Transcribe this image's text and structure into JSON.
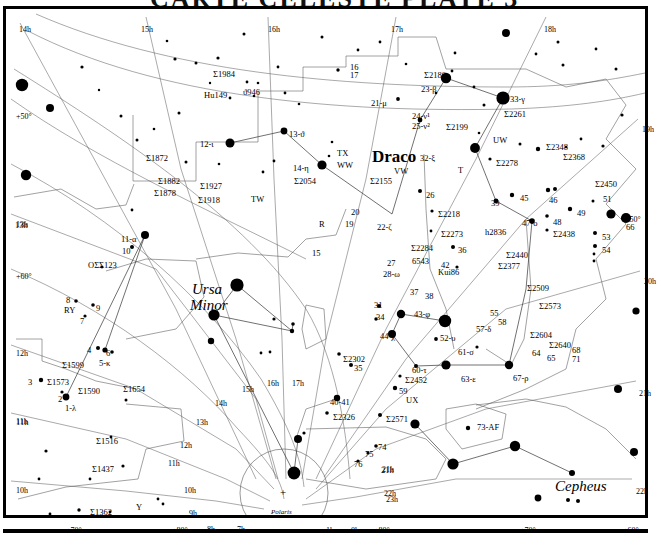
{
  "page": {
    "title_clipped": "CARTE CELESTE  PLATE 3",
    "width": 657,
    "height": 539
  },
  "constellations": [
    {
      "name": "Draco",
      "x": 366,
      "y": 139,
      "style": "draco"
    },
    {
      "name": "Ursa",
      "x": 186,
      "y": 273,
      "style": "const"
    },
    {
      "name": "Minor",
      "x": 184,
      "y": 289,
      "style": "const"
    },
    {
      "name": "Cepheus",
      "x": 549,
      "y": 470,
      "style": "const"
    }
  ],
  "pole": {
    "label": "Polaris",
    "x": 271,
    "y": 504,
    "marker": "+",
    "marker_x": 276,
    "marker_y": 483
  },
  "ra_labels": [
    {
      "t": "14h",
      "x": 13,
      "y": 17
    },
    {
      "t": "15h",
      "x": 135,
      "y": 17
    },
    {
      "t": "16h",
      "x": 262,
      "y": 17
    },
    {
      "t": "17h",
      "x": 385,
      "y": 17
    },
    {
      "t": "18h",
      "x": 538,
      "y": 17
    },
    {
      "t": "19h",
      "x": 636,
      "y": 117
    },
    {
      "t": "20h",
      "x": 638,
      "y": 269
    },
    {
      "t": "21h",
      "x": 633,
      "y": 381
    },
    {
      "t": "22h",
      "x": 630,
      "y": 479
    },
    {
      "t": "13h",
      "x": 10,
      "y": 212
    },
    {
      "t": "12h",
      "x": 10,
      "y": 341
    },
    {
      "t": "11h",
      "x": 10,
      "y": 409
    },
    {
      "t": "10h",
      "x": 10,
      "y": 478
    },
    {
      "t": "14h",
      "x": 209,
      "y": 391
    },
    {
      "t": "15h",
      "x": 236,
      "y": 377
    },
    {
      "t": "16h",
      "x": 261,
      "y": 371
    },
    {
      "t": "17h",
      "x": 286,
      "y": 371
    },
    {
      "t": "13h",
      "x": 190,
      "y": 410
    },
    {
      "t": "12h",
      "x": 174,
      "y": 433
    },
    {
      "t": "11h",
      "x": 162,
      "y": 451
    },
    {
      "t": "10h",
      "x": 178,
      "y": 478
    },
    {
      "t": "9h",
      "x": 183,
      "y": 501
    },
    {
      "t": "8h",
      "x": 201,
      "y": 517
    },
    {
      "t": "7h",
      "x": 231,
      "y": 517
    },
    {
      "t": "1h",
      "x": 320,
      "y": 518
    },
    {
      "t": "0h",
      "x": 345,
      "y": 518
    },
    {
      "t": "23h",
      "x": 380,
      "y": 487
    },
    {
      "t": "22h",
      "x": 378,
      "y": 481
    },
    {
      "t": "21h",
      "x": 376,
      "y": 457
    }
  ],
  "dec_labels": [
    {
      "t": "+50°",
      "x": 10,
      "y": 104
    },
    {
      "t": "+60°",
      "x": 10,
      "y": 264
    },
    {
      "t": "+70°",
      "x": 60,
      "y": 518
    },
    {
      "t": "+80°",
      "x": 166,
      "y": 518
    },
    {
      "t": "+80°",
      "x": 368,
      "y": 518
    },
    {
      "t": "+70°",
      "x": 514,
      "y": 518
    },
    {
      "t": "+60°",
      "x": 617,
      "y": 518
    },
    {
      "t": "+50°",
      "x": 619,
      "y": 207
    }
  ],
  "star_labels": [
    {
      "t": "Σ1984",
      "x": 207,
      "y": 61
    },
    {
      "t": "Hu149",
      "x": 198,
      "y": 82
    },
    {
      "t": "ϑ946",
      "x": 237,
      "y": 79
    },
    {
      "t": "16",
      "x": 344,
      "y": 54
    },
    {
      "t": "17",
      "x": 344,
      "y": 62
    },
    {
      "t": "Σ2180",
      "x": 418,
      "y": 62
    },
    {
      "t": "23-β",
      "x": 415,
      "y": 76
    },
    {
      "t": "21-μ",
      "x": 365,
      "y": 90
    },
    {
      "t": "24-ν¹",
      "x": 406,
      "y": 103
    },
    {
      "t": "25-ν²",
      "x": 406,
      "y": 113
    },
    {
      "t": "Σ2199",
      "x": 440,
      "y": 114
    },
    {
      "t": "33-γ",
      "x": 504,
      "y": 86
    },
    {
      "t": "Σ2261",
      "x": 498,
      "y": 101
    },
    {
      "t": "UW",
      "x": 487,
      "y": 127
    },
    {
      "t": "12-ι",
      "x": 194,
      "y": 131
    },
    {
      "t": "13-ϑ",
      "x": 283,
      "y": 121
    },
    {
      "t": "TX",
      "x": 331,
      "y": 140
    },
    {
      "t": "WW",
      "x": 331,
      "y": 152
    },
    {
      "t": "14-η",
      "x": 287,
      "y": 155
    },
    {
      "t": "Σ2054",
      "x": 288,
      "y": 168
    },
    {
      "t": "VW",
      "x": 388,
      "y": 158
    },
    {
      "t": "Σ2155",
      "x": 364,
      "y": 168
    },
    {
      "t": "32-ξ",
      "x": 414,
      "y": 145
    },
    {
      "t": "T",
      "x": 452,
      "y": 157
    },
    {
      "t": "Σ2278",
      "x": 490,
      "y": 150
    },
    {
      "t": "Σ2348",
      "x": 540,
      "y": 134
    },
    {
      "t": "Σ2368",
      "x": 557,
      "y": 144
    },
    {
      "t": "Σ2450",
      "x": 589,
      "y": 171
    },
    {
      "t": "Σ1872",
      "x": 140,
      "y": 145
    },
    {
      "t": "Σ1882",
      "x": 152,
      "y": 168
    },
    {
      "t": "Σ1878",
      "x": 148,
      "y": 180
    },
    {
      "t": "Σ1927",
      "x": 194,
      "y": 173
    },
    {
      "t": "Σ1918",
      "x": 192,
      "y": 187
    },
    {
      "t": "TW",
      "x": 245,
      "y": 186
    },
    {
      "t": "26",
      "x": 420,
      "y": 182
    },
    {
      "t": "39",
      "x": 485,
      "y": 190
    },
    {
      "t": "45",
      "x": 514,
      "y": 185
    },
    {
      "t": "46",
      "x": 543,
      "y": 187
    },
    {
      "t": "49",
      "x": 571,
      "y": 200
    },
    {
      "t": "51",
      "x": 597,
      "y": 186
    },
    {
      "t": "Σ2218",
      "x": 432,
      "y": 201
    },
    {
      "t": "h2836",
      "x": 479,
      "y": 219
    },
    {
      "t": "47-o",
      "x": 516,
      "y": 210
    },
    {
      "t": "48",
      "x": 547,
      "y": 209
    },
    {
      "t": "Σ2438",
      "x": 547,
      "y": 221
    },
    {
      "t": "53",
      "x": 596,
      "y": 224
    },
    {
      "t": "54",
      "x": 596,
      "y": 237
    },
    {
      "t": "66",
      "x": 620,
      "y": 214
    },
    {
      "t": "13h",
      "x": 9,
      "y": 212
    },
    {
      "t": "11-α",
      "x": 115,
      "y": 226
    },
    {
      "t": "10",
      "x": 116,
      "y": 238
    },
    {
      "t": "OΣΣ123",
      "x": 82,
      "y": 252
    },
    {
      "t": "Σ2273",
      "x": 435,
      "y": 221
    },
    {
      "t": "36",
      "x": 452,
      "y": 237
    },
    {
      "t": "Σ2284",
      "x": 405,
      "y": 235
    },
    {
      "t": "6543",
      "x": 406,
      "y": 248
    },
    {
      "t": "42",
      "x": 435,
      "y": 252
    },
    {
      "t": "Kui86",
      "x": 432,
      "y": 259
    },
    {
      "t": "Σ2440",
      "x": 500,
      "y": 242
    },
    {
      "t": "Σ2377",
      "x": 492,
      "y": 253
    },
    {
      "t": "Σ2509",
      "x": 521,
      "y": 275
    },
    {
      "t": "Σ2573",
      "x": 533,
      "y": 293
    },
    {
      "t": "15",
      "x": 306,
      "y": 240
    },
    {
      "t": "R",
      "x": 313,
      "y": 211
    },
    {
      "t": "20",
      "x": 345,
      "y": 199
    },
    {
      "t": "19",
      "x": 339,
      "y": 211
    },
    {
      "t": "22-ζ",
      "x": 371,
      "y": 214
    },
    {
      "t": "27",
      "x": 381,
      "y": 250
    },
    {
      "t": "28-ω",
      "x": 377,
      "y": 261
    },
    {
      "t": "37",
      "x": 404,
      "y": 279
    },
    {
      "t": "38",
      "x": 419,
      "y": 283
    },
    {
      "t": "31",
      "x": 368,
      "y": 292
    },
    {
      "t": "34",
      "x": 370,
      "y": 304
    },
    {
      "t": "43-φ",
      "x": 408,
      "y": 301
    },
    {
      "t": "44-χ",
      "x": 374,
      "y": 323
    },
    {
      "t": "52-υ",
      "x": 434,
      "y": 325
    },
    {
      "t": "55",
      "x": 484,
      "y": 300
    },
    {
      "t": "58",
      "x": 492,
      "y": 309
    },
    {
      "t": "57-δ",
      "x": 470,
      "y": 316
    },
    {
      "t": "61-σ",
      "x": 452,
      "y": 339
    },
    {
      "t": "8",
      "x": 60,
      "y": 287
    },
    {
      "t": "RY",
      "x": 58,
      "y": 297
    },
    {
      "t": "9",
      "x": 90,
      "y": 295
    },
    {
      "t": "7",
      "x": 74,
      "y": 308
    },
    {
      "t": "4",
      "x": 81,
      "y": 337
    },
    {
      "t": "6",
      "x": 100,
      "y": 340
    },
    {
      "t": "5-κ",
      "x": 93,
      "y": 350
    },
    {
      "t": "Σ1599",
      "x": 56,
      "y": 352
    },
    {
      "t": "3",
      "x": 22,
      "y": 369
    },
    {
      "t": "Σ1573",
      "x": 41,
      "y": 369
    },
    {
      "t": "Σ1590",
      "x": 72,
      "y": 378
    },
    {
      "t": "Σ1654",
      "x": 117,
      "y": 376
    },
    {
      "t": "2",
      "x": 52,
      "y": 386
    },
    {
      "t": "1-λ",
      "x": 59,
      "y": 395
    },
    {
      "t": "11h",
      "x": 10,
      "y": 409
    },
    {
      "t": "Σ1516",
      "x": 90,
      "y": 428
    },
    {
      "t": "Σ1437",
      "x": 86,
      "y": 456
    },
    {
      "t": "Σ1362",
      "x": 84,
      "y": 499
    },
    {
      "t": "Y",
      "x": 130,
      "y": 494
    },
    {
      "t": "Σ2604",
      "x": 524,
      "y": 322
    },
    {
      "t": "Σ2640",
      "x": 543,
      "y": 332
    },
    {
      "t": "64",
      "x": 526,
      "y": 340
    },
    {
      "t": "65",
      "x": 541,
      "y": 345
    },
    {
      "t": "68",
      "x": 566,
      "y": 337
    },
    {
      "t": "71",
      "x": 566,
      "y": 346
    },
    {
      "t": "67-ρ",
      "x": 507,
      "y": 365
    },
    {
      "t": "63-ε",
      "x": 455,
      "y": 366
    },
    {
      "t": "60-τ",
      "x": 406,
      "y": 357
    },
    {
      "t": "Σ2452",
      "x": 399,
      "y": 367
    },
    {
      "t": "59",
      "x": 393,
      "y": 378
    },
    {
      "t": "UX",
      "x": 400,
      "y": 387
    },
    {
      "t": "Σ2302",
      "x": 337,
      "y": 346
    },
    {
      "t": "35",
      "x": 348,
      "y": 355
    },
    {
      "t": "40-41",
      "x": 324,
      "y": 389
    },
    {
      "t": "Σ2326",
      "x": 327,
      "y": 404
    },
    {
      "t": "Σ2571",
      "x": 380,
      "y": 406
    },
    {
      "t": "73-AF",
      "x": 471,
      "y": 414
    },
    {
      "t": "74",
      "x": 372,
      "y": 434
    },
    {
      "t": "75",
      "x": 359,
      "y": 441
    },
    {
      "t": "76",
      "x": 348,
      "y": 451
    },
    {
      "t": "21h",
      "x": 375,
      "y": 457
    }
  ],
  "stars": [
    {
      "x": 16,
      "y": 76,
      "r": 6.2
    },
    {
      "x": 44,
      "y": 99,
      "r": 4.0
    },
    {
      "x": 20,
      "y": 166,
      "r": 5.2
    },
    {
      "x": 76,
      "y": 58,
      "r": 1.6
    },
    {
      "x": 93,
      "y": 81,
      "r": 1.2
    },
    {
      "x": 115,
      "y": 107,
      "r": 1.5
    },
    {
      "x": 161,
      "y": 32,
      "r": 1.3
    },
    {
      "x": 169,
      "y": 50,
      "r": 1.6
    },
    {
      "x": 131,
      "y": 131,
      "r": 1.5
    },
    {
      "x": 148,
      "y": 120,
      "r": 1.3
    },
    {
      "x": 173,
      "y": 104,
      "r": 1.5
    },
    {
      "x": 180,
      "y": 153,
      "r": 1.5
    },
    {
      "x": 126,
      "y": 201,
      "r": 1.4
    },
    {
      "x": 212,
      "y": 49,
      "r": 1.6
    },
    {
      "x": 224,
      "y": 89,
      "r": 1.4
    },
    {
      "x": 238,
      "y": 25,
      "r": 1.5
    },
    {
      "x": 241,
      "y": 73,
      "r": 1.4
    },
    {
      "x": 252,
      "y": 74,
      "r": 1.3
    },
    {
      "x": 248,
      "y": 87,
      "r": 1.3
    },
    {
      "x": 190,
      "y": 54,
      "r": 1.5
    },
    {
      "x": 204,
      "y": 74,
      "r": 1.2
    },
    {
      "x": 272,
      "y": 58,
      "r": 1.4
    },
    {
      "x": 279,
      "y": 84,
      "r": 1.4
    },
    {
      "x": 293,
      "y": 95,
      "r": 1.3
    },
    {
      "x": 224,
      "y": 134,
      "r": 4.5
    },
    {
      "x": 278,
      "y": 122,
      "r": 3.4
    },
    {
      "x": 213,
      "y": 155,
      "r": 1.3
    },
    {
      "x": 257,
      "y": 163,
      "r": 1.4
    },
    {
      "x": 268,
      "y": 152,
      "r": 1.4
    },
    {
      "x": 316,
      "y": 156,
      "r": 4.6
    },
    {
      "x": 326,
      "y": 133,
      "r": 1.3
    },
    {
      "x": 323,
      "y": 147,
      "r": 1.3
    },
    {
      "x": 332,
      "y": 61,
      "r": 1.7
    },
    {
      "x": 352,
      "y": 41,
      "r": 1.4
    },
    {
      "x": 316,
      "y": 28,
      "r": 1.5
    },
    {
      "x": 374,
      "y": 33,
      "r": 1.4
    },
    {
      "x": 392,
      "y": 90,
      "r": 1.9
    },
    {
      "x": 400,
      "y": 55,
      "r": 1.3
    },
    {
      "x": 440,
      "y": 69,
      "r": 5.2
    },
    {
      "x": 446,
      "y": 62,
      "r": 1.4
    },
    {
      "x": 449,
      "y": 44,
      "r": 1.4
    },
    {
      "x": 414,
      "y": 111,
      "r": 2.4
    },
    {
      "x": 430,
      "y": 84,
      "r": 1.3
    },
    {
      "x": 468,
      "y": 78,
      "r": 1.4
    },
    {
      "x": 497,
      "y": 89,
      "r": 6.6
    },
    {
      "x": 478,
      "y": 96,
      "r": 1.5
    },
    {
      "x": 469,
      "y": 139,
      "r": 4.9
    },
    {
      "x": 484,
      "y": 150,
      "r": 1.6
    },
    {
      "x": 473,
      "y": 124,
      "r": 1.3
    },
    {
      "x": 500,
      "y": 24,
      "r": 4.0
    },
    {
      "x": 552,
      "y": 33,
      "r": 1.5
    },
    {
      "x": 530,
      "y": 45,
      "r": 1.4
    },
    {
      "x": 557,
      "y": 56,
      "r": 1.5
    },
    {
      "x": 590,
      "y": 40,
      "r": 1.4
    },
    {
      "x": 532,
      "y": 140,
      "r": 2.2
    },
    {
      "x": 514,
      "y": 135,
      "r": 1.5
    },
    {
      "x": 560,
      "y": 138,
      "r": 1.3
    },
    {
      "x": 575,
      "y": 130,
      "r": 1.4
    },
    {
      "x": 597,
      "y": 137,
      "r": 1.6
    },
    {
      "x": 610,
      "y": 60,
      "r": 1.5
    },
    {
      "x": 616,
      "y": 106,
      "r": 1.6
    },
    {
      "x": 620,
      "y": 209,
      "r": 5.1
    },
    {
      "x": 605,
      "y": 205,
      "r": 4.6
    },
    {
      "x": 587,
      "y": 192,
      "r": 1.5
    },
    {
      "x": 542,
      "y": 181,
      "r": 2.2
    },
    {
      "x": 549,
      "y": 180,
      "r": 2.0
    },
    {
      "x": 506,
      "y": 186,
      "r": 2.2
    },
    {
      "x": 490,
      "y": 192,
      "r": 2.4
    },
    {
      "x": 414,
      "y": 182,
      "r": 2.0
    },
    {
      "x": 426,
      "y": 202,
      "r": 1.6
    },
    {
      "x": 425,
      "y": 222,
      "r": 1.4
    },
    {
      "x": 564,
      "y": 200,
      "r": 2.2
    },
    {
      "x": 589,
      "y": 224,
      "r": 2.0
    },
    {
      "x": 589,
      "y": 237,
      "r": 2.0
    },
    {
      "x": 588,
      "y": 245,
      "r": 1.4
    },
    {
      "x": 588,
      "y": 252,
      "r": 1.4
    },
    {
      "x": 526,
      "y": 212,
      "r": 2.8
    },
    {
      "x": 541,
      "y": 207,
      "r": 1.8
    },
    {
      "x": 541,
      "y": 221,
      "r": 1.6
    },
    {
      "x": 447,
      "y": 238,
      "r": 2.0
    },
    {
      "x": 451,
      "y": 258,
      "r": 1.6
    },
    {
      "x": 139,
      "y": 226,
      "r": 4.0
    },
    {
      "x": 126,
      "y": 238,
      "r": 2.0
    },
    {
      "x": 96,
      "y": 258,
      "r": 1.4
    },
    {
      "x": 70,
      "y": 292,
      "r": 1.8
    },
    {
      "x": 87,
      "y": 296,
      "r": 1.8
    },
    {
      "x": 79,
      "y": 307,
      "r": 1.6
    },
    {
      "x": 92,
      "y": 339,
      "r": 2.0
    },
    {
      "x": 99,
      "y": 341,
      "r": 2.6
    },
    {
      "x": 106,
      "y": 343,
      "r": 1.8
    },
    {
      "x": 35,
      "y": 371,
      "r": 2.2
    },
    {
      "x": 60,
      "y": 388,
      "r": 3.4
    },
    {
      "x": 56,
      "y": 383,
      "r": 1.6
    },
    {
      "x": 120,
      "y": 391,
      "r": 1.5
    },
    {
      "x": 105,
      "y": 428,
      "r": 1.4
    },
    {
      "x": 117,
      "y": 457,
      "r": 1.6
    },
    {
      "x": 84,
      "y": 470,
      "r": 1.4
    },
    {
      "x": 73,
      "y": 501,
      "r": 1.7
    },
    {
      "x": 104,
      "y": 503,
      "r": 1.4
    },
    {
      "x": 44,
      "y": 505,
      "r": 1.4
    },
    {
      "x": 152,
      "y": 490,
      "r": 1.4
    },
    {
      "x": 157,
      "y": 495,
      "r": 1.4
    },
    {
      "x": 40,
      "y": 442,
      "r": 1.6
    },
    {
      "x": 33,
      "y": 470,
      "r": 1.4
    },
    {
      "x": 231,
      "y": 276,
      "r": 6.6
    },
    {
      "x": 208,
      "y": 306,
      "r": 5.6
    },
    {
      "x": 205,
      "y": 332,
      "r": 3.2
    },
    {
      "x": 255,
      "y": 344,
      "r": 1.4
    },
    {
      "x": 264,
      "y": 343,
      "r": 1.4
    },
    {
      "x": 286,
      "y": 322,
      "r": 2.2
    },
    {
      "x": 268,
      "y": 310,
      "r": 1.6
    },
    {
      "x": 287,
      "y": 315,
      "r": 1.8
    },
    {
      "x": 288,
      "y": 464,
      "r": 6.4
    },
    {
      "x": 292,
      "y": 430,
      "r": 4.0
    },
    {
      "x": 298,
      "y": 424,
      "r": 1.6
    },
    {
      "x": 257,
      "y": 512,
      "r": 4.0
    },
    {
      "x": 373,
      "y": 297,
      "r": 2.0
    },
    {
      "x": 370,
      "y": 310,
      "r": 1.7
    },
    {
      "x": 395,
      "y": 305,
      "r": 4.2
    },
    {
      "x": 386,
      "y": 325,
      "r": 4.0
    },
    {
      "x": 439,
      "y": 312,
      "r": 6.2
    },
    {
      "x": 430,
      "y": 330,
      "r": 1.9
    },
    {
      "x": 471,
      "y": 338,
      "r": 1.6
    },
    {
      "x": 440,
      "y": 356,
      "r": 4.6
    },
    {
      "x": 503,
      "y": 356,
      "r": 4.2
    },
    {
      "x": 410,
      "y": 357,
      "r": 2.0
    },
    {
      "x": 394,
      "y": 367,
      "r": 1.6
    },
    {
      "x": 389,
      "y": 379,
      "r": 2.2
    },
    {
      "x": 333,
      "y": 345,
      "r": 1.8
    },
    {
      "x": 345,
      "y": 356,
      "r": 2.0
    },
    {
      "x": 331,
      "y": 389,
      "r": 3.2
    },
    {
      "x": 321,
      "y": 404,
      "r": 1.8
    },
    {
      "x": 374,
      "y": 406,
      "r": 2.0
    },
    {
      "x": 409,
      "y": 415,
      "r": 4.6
    },
    {
      "x": 462,
      "y": 419,
      "r": 2.2
    },
    {
      "x": 509,
      "y": 437,
      "r": 5.2
    },
    {
      "x": 447,
      "y": 455,
      "r": 5.6
    },
    {
      "x": 532,
      "y": 489,
      "r": 3.4
    },
    {
      "x": 562,
      "y": 491,
      "r": 2.0
    },
    {
      "x": 572,
      "y": 492,
      "r": 2.0
    },
    {
      "x": 566,
      "y": 464,
      "r": 3.0
    },
    {
      "x": 630,
      "y": 302,
      "r": 3.6
    },
    {
      "x": 612,
      "y": 380,
      "r": 4.0
    },
    {
      "x": 628,
      "y": 443,
      "r": 4.0
    },
    {
      "x": 370,
      "y": 437,
      "r": 1.8
    },
    {
      "x": 362,
      "y": 444,
      "r": 1.6
    },
    {
      "x": 352,
      "y": 452,
      "r": 1.6
    }
  ]
}
